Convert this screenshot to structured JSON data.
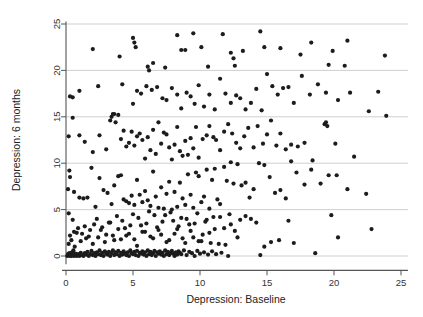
{
  "chart_data": {
    "type": "scatter",
    "title": "",
    "xlabel": "Depression: Baseline",
    "ylabel": "Depression: 6 months",
    "xlim": [
      -0.6,
      25.8
    ],
    "ylim": [
      -0.9,
      25.6
    ],
    "xticks": [
      0,
      5,
      10,
      15,
      20,
      25
    ],
    "yticks": [
      0,
      5,
      10,
      15,
      20,
      25
    ],
    "xtick_labels": [
      "0",
      "5",
      "10",
      "15",
      "20",
      "25"
    ],
    "ytick_labels": [
      "0",
      "5",
      "10",
      "15",
      "20",
      "25"
    ],
    "grid": "horizontal",
    "grid_color": "#c9c9c9",
    "legend": "none",
    "marker": "filled-circle",
    "marker_color": "#1c1c1c",
    "marker_size": 3.1,
    "n_points": 436,
    "points": [
      [
        0.1,
        0.0
      ],
      [
        0.2,
        0.1
      ],
      [
        0.3,
        0.0
      ],
      [
        0.15,
        0.2
      ],
      [
        0.4,
        0.0
      ],
      [
        0.25,
        0.3
      ],
      [
        0.5,
        0.1
      ],
      [
        0.6,
        0.0
      ],
      [
        0.35,
        0.15
      ],
      [
        0.7,
        0.25
      ],
      [
        0.8,
        0.0
      ],
      [
        0.45,
        0.4
      ],
      [
        0.9,
        0.2
      ],
      [
        1.0,
        0.0
      ],
      [
        1.1,
        0.35
      ],
      [
        1.2,
        0.1
      ],
      [
        0.55,
        0.6
      ],
      [
        1.3,
        0.0
      ],
      [
        1.4,
        0.3
      ],
      [
        1.5,
        0.15
      ],
      [
        0.65,
        1.0
      ],
      [
        1.6,
        0.45
      ],
      [
        1.7,
        0.0
      ],
      [
        1.8,
        0.2
      ],
      [
        0.2,
        1.3
      ],
      [
        1.9,
        0.55
      ],
      [
        2.0,
        0.1
      ],
      [
        2.1,
        0.3
      ],
      [
        0.4,
        1.7
      ],
      [
        2.2,
        0.0
      ],
      [
        2.3,
        0.4
      ],
      [
        2.4,
        0.2
      ],
      [
        0.3,
        2.2
      ],
      [
        2.5,
        0.6
      ],
      [
        2.6,
        0.1
      ],
      [
        2.7,
        0.35
      ],
      [
        0.6,
        2.6
      ],
      [
        2.8,
        0.0
      ],
      [
        2.9,
        0.5
      ],
      [
        3.0,
        0.25
      ],
      [
        0.9,
        3.0
      ],
      [
        3.1,
        0.15
      ],
      [
        3.2,
        0.45
      ],
      [
        3.3,
        0.0
      ],
      [
        1.2,
        2.4
      ],
      [
        3.4,
        0.3
      ],
      [
        3.5,
        0.6
      ],
      [
        3.6,
        0.1
      ],
      [
        1.5,
        1.9
      ],
      [
        3.7,
        0.4
      ],
      [
        3.8,
        0.2
      ],
      [
        3.9,
        0.55
      ],
      [
        1.8,
        2.8
      ],
      [
        4.0,
        0.0
      ],
      [
        4.1,
        0.35
      ],
      [
        4.2,
        0.15
      ],
      [
        2.1,
        3.4
      ],
      [
        4.3,
        0.5
      ],
      [
        4.4,
        0.25
      ],
      [
        4.5,
        0.1
      ],
      [
        2.4,
        2.0
      ],
      [
        4.6,
        0.4
      ],
      [
        4.7,
        0.0
      ],
      [
        4.8,
        0.6
      ],
      [
        2.7,
        3.1
      ],
      [
        4.9,
        0.3
      ],
      [
        5.0,
        0.2
      ],
      [
        5.1,
        0.45
      ],
      [
        3.0,
        2.3
      ],
      [
        5.2,
        0.1
      ],
      [
        5.3,
        0.55
      ],
      [
        5.4,
        0.0
      ],
      [
        3.3,
        3.6
      ],
      [
        5.5,
        0.35
      ],
      [
        5.6,
        0.25
      ],
      [
        5.7,
        0.5
      ],
      [
        3.6,
        1.7
      ],
      [
        5.8,
        0.15
      ],
      [
        5.9,
        0.4
      ],
      [
        6.0,
        0.0
      ],
      [
        3.9,
        2.9
      ],
      [
        6.1,
        0.6
      ],
      [
        6.2,
        0.2
      ],
      [
        6.3,
        0.45
      ],
      [
        4.2,
        3.8
      ],
      [
        6.4,
        0.1
      ],
      [
        6.5,
        0.3
      ],
      [
        6.6,
        0.55
      ],
      [
        4.5,
        2.2
      ],
      [
        6.7,
        0.0
      ],
      [
        6.8,
        0.4
      ],
      [
        6.9,
        0.25
      ],
      [
        4.8,
        3.3
      ],
      [
        7.0,
        0.5
      ],
      [
        7.1,
        0.15
      ],
      [
        7.2,
        0.35
      ],
      [
        5.1,
        1.8
      ],
      [
        7.3,
        0.0
      ],
      [
        7.4,
        0.6
      ],
      [
        7.5,
        0.2
      ],
      [
        5.4,
        4.1
      ],
      [
        7.6,
        0.45
      ],
      [
        7.7,
        0.1
      ],
      [
        7.8,
        0.3
      ],
      [
        5.7,
        2.6
      ],
      [
        7.9,
        0.55
      ],
      [
        8.0,
        0.25
      ],
      [
        8.1,
        0.0
      ],
      [
        6.0,
        3.5
      ],
      [
        8.2,
        0.4
      ],
      [
        8.3,
        0.15
      ],
      [
        8.4,
        0.5
      ],
      [
        6.3,
        2.1
      ],
      [
        8.5,
        0.35
      ],
      [
        8.6,
        0.2
      ],
      [
        8.8,
        0.6
      ],
      [
        6.6,
        4.4
      ],
      [
        9.0,
        0.1
      ],
      [
        9.2,
        0.45
      ],
      [
        9.4,
        0.3
      ],
      [
        6.9,
        2.8
      ],
      [
        9.6,
        0.0
      ],
      [
        9.8,
        0.55
      ],
      [
        10.0,
        0.25
      ],
      [
        7.2,
        3.7
      ],
      [
        10.3,
        0.4
      ],
      [
        10.6,
        0.15
      ],
      [
        10.9,
        0.5
      ],
      [
        7.5,
        1.5
      ],
      [
        11.2,
        0.2
      ],
      [
        11.6,
        0.35
      ],
      [
        12.1,
        0.0
      ],
      [
        7.8,
        4.7
      ],
      [
        14.5,
        0.1
      ],
      [
        18.6,
        0.3
      ],
      [
        8.1,
        2.4
      ],
      [
        8.4,
        3.2
      ],
      [
        8.7,
        1.9
      ],
      [
        9.0,
        4.0
      ],
      [
        9.3,
        2.7
      ],
      [
        9.6,
        3.5
      ],
      [
        9.9,
        1.6
      ],
      [
        10.2,
        2.3
      ],
      [
        10.5,
        3.9
      ],
      [
        10.8,
        1.4
      ],
      [
        11.1,
        2.9
      ],
      [
        11.5,
        4.2
      ],
      [
        11.9,
        1.2
      ],
      [
        12.3,
        3.4
      ],
      [
        12.8,
        2.0
      ],
      [
        0.2,
        4.6
      ],
      [
        0.5,
        3.9
      ],
      [
        0.8,
        2.5
      ],
      [
        1.1,
        1.6
      ],
      [
        1.4,
        3.2
      ],
      [
        1.7,
        2.1
      ],
      [
        2.0,
        1.3
      ],
      [
        2.3,
        4.0
      ],
      [
        2.6,
        2.8
      ],
      [
        2.9,
        1.5
      ],
      [
        3.2,
        3.6
      ],
      [
        3.5,
        2.2
      ],
      [
        3.8,
        4.3
      ],
      [
        4.1,
        1.8
      ],
      [
        4.4,
        3.0
      ],
      [
        4.7,
        2.4
      ],
      [
        5.0,
        4.5
      ],
      [
        5.3,
        1.1
      ],
      [
        5.6,
        3.3
      ],
      [
        5.9,
        2.6
      ],
      [
        6.2,
        4.8
      ],
      [
        6.5,
        1.9
      ],
      [
        6.8,
        3.1
      ],
      [
        7.1,
        2.3
      ],
      [
        7.4,
        4.4
      ],
      [
        7.7,
        1.7
      ],
      [
        8.0,
        3.8
      ],
      [
        8.3,
        2.9
      ],
      [
        8.6,
        4.1
      ],
      [
        8.9,
        1.4
      ],
      [
        9.2,
        3.4
      ],
      [
        9.5,
        2.0
      ],
      [
        9.8,
        4.6
      ],
      [
        10.1,
        1.6
      ],
      [
        10.4,
        3.7
      ],
      [
        10.7,
        2.5
      ],
      [
        11.0,
        4.2
      ],
      [
        11.4,
        1.3
      ],
      [
        11.8,
        3.0
      ],
      [
        12.2,
        4.5
      ],
      [
        12.6,
        2.7
      ],
      [
        13.0,
        3.9
      ],
      [
        13.4,
        4.3
      ],
      [
        13.8,
        4.0
      ],
      [
        14.2,
        3.6
      ],
      [
        14.8,
        1.0
      ],
      [
        15.3,
        1.5
      ],
      [
        15.9,
        1.7
      ],
      [
        16.6,
        3.8
      ],
      [
        17.0,
        1.4
      ],
      [
        19.8,
        4.4
      ],
      [
        20.3,
        2.0
      ],
      [
        22.8,
        2.9
      ],
      [
        0.15,
        7.2
      ],
      [
        0.3,
        8.5
      ],
      [
        0.25,
        9.2
      ],
      [
        0.6,
        6.9
      ],
      [
        1.0,
        6.3
      ],
      [
        1.3,
        6.2
      ],
      [
        1.6,
        6.3
      ],
      [
        1.9,
        9.5
      ],
      [
        2.2,
        5.3
      ],
      [
        2.5,
        8.4
      ],
      [
        2.8,
        7.1
      ],
      [
        3.1,
        6.8
      ],
      [
        3.4,
        5.6
      ],
      [
        3.6,
        7.6
      ],
      [
        3.9,
        8.6
      ],
      [
        4.1,
        8.7
      ],
      [
        4.3,
        6.1
      ],
      [
        4.5,
        5.9
      ],
      [
        4.7,
        5.7
      ],
      [
        4.9,
        6.5
      ],
      [
        5.1,
        5.5
      ],
      [
        5.3,
        8.2
      ],
      [
        5.5,
        6.6
      ],
      [
        5.7,
        5.8
      ],
      [
        5.9,
        7.0
      ],
      [
        6.1,
        6.0
      ],
      [
        6.3,
        5.4
      ],
      [
        6.5,
        9.1
      ],
      [
        6.7,
        6.4
      ],
      [
        6.9,
        5.2
      ],
      [
        7.1,
        7.4
      ],
      [
        7.3,
        5.1
      ],
      [
        7.5,
        6.7
      ],
      [
        7.7,
        8.0
      ],
      [
        7.9,
        5.0
      ],
      [
        8.1,
        6.9
      ],
      [
        8.3,
        5.3
      ],
      [
        8.5,
        7.9
      ],
      [
        8.7,
        6.2
      ],
      [
        8.9,
        5.5
      ],
      [
        9.1,
        8.8
      ],
      [
        9.3,
        6.6
      ],
      [
        9.5,
        5.2
      ],
      [
        9.7,
        9.0
      ],
      [
        9.9,
        8.6
      ],
      [
        10.1,
        5.8
      ],
      [
        10.3,
        6.4
      ],
      [
        10.5,
        9.3
      ],
      [
        10.7,
        5.1
      ],
      [
        10.9,
        8.2
      ],
      [
        11.1,
        9.4
      ],
      [
        11.3,
        6.1
      ],
      [
        11.5,
        5.6
      ],
      [
        11.8,
        9.6
      ],
      [
        12.0,
        8.1
      ],
      [
        12.3,
        10.1
      ],
      [
        12.5,
        7.8
      ],
      [
        12.8,
        9.9
      ],
      [
        13.1,
        7.6
      ],
      [
        13.4,
        7.9
      ],
      [
        13.7,
        6.3
      ],
      [
        14.0,
        7.2
      ],
      [
        14.4,
        10.0
      ],
      [
        14.8,
        9.8
      ],
      [
        15.2,
        8.5
      ],
      [
        15.6,
        6.8
      ],
      [
        16.0,
        7.1
      ],
      [
        16.4,
        6.2
      ],
      [
        16.8,
        10.2
      ],
      [
        17.2,
        9.0
      ],
      [
        17.8,
        7.7
      ],
      [
        18.3,
        9.3
      ],
      [
        19.0,
        7.8
      ],
      [
        19.6,
        8.7
      ],
      [
        20.2,
        8.7
      ],
      [
        21.0,
        7.2
      ],
      [
        21.5,
        10.7
      ],
      [
        22.4,
        6.7
      ],
      [
        0.2,
        12.9
      ],
      [
        0.5,
        14.9
      ],
      [
        1.0,
        13.0
      ],
      [
        1.4,
        12.3
      ],
      [
        2.0,
        11.2
      ],
      [
        2.5,
        13.0
      ],
      [
        3.0,
        11.5
      ],
      [
        3.3,
        14.6
      ],
      [
        3.5,
        15.3
      ],
      [
        3.7,
        14.4
      ],
      [
        3.9,
        15.2
      ],
      [
        4.1,
        12.6
      ],
      [
        4.3,
        13.5
      ],
      [
        4.5,
        11.8
      ],
      [
        4.7,
        12.2
      ],
      [
        4.9,
        13.4
      ],
      [
        5.1,
        11.9
      ],
      [
        5.3,
        12.9
      ],
      [
        5.5,
        13.2
      ],
      [
        5.7,
        12.5
      ],
      [
        5.9,
        10.5
      ],
      [
        6.1,
        12.8
      ],
      [
        6.3,
        11.4
      ],
      [
        6.5,
        13.6
      ],
      [
        6.7,
        11.0
      ],
      [
        6.9,
        14.4
      ],
      [
        7.1,
        12.1
      ],
      [
        7.3,
        13.3
      ],
      [
        7.5,
        13.1
      ],
      [
        7.7,
        11.7
      ],
      [
        7.9,
        10.4
      ],
      [
        8.1,
        12.0
      ],
      [
        8.3,
        13.9
      ],
      [
        8.5,
        11.3
      ],
      [
        8.7,
        10.8
      ],
      [
        8.9,
        12.4
      ],
      [
        9.1,
        10.9
      ],
      [
        9.3,
        12.7
      ],
      [
        9.5,
        11.6
      ],
      [
        9.7,
        13.9
      ],
      [
        9.9,
        10.6
      ],
      [
        10.2,
        12.6
      ],
      [
        10.5,
        13.0
      ],
      [
        10.7,
        14.0
      ],
      [
        11.0,
        12.8
      ],
      [
        11.2,
        12.5
      ],
      [
        11.5,
        11.4
      ],
      [
        11.8,
        13.4
      ],
      [
        12.1,
        14.2
      ],
      [
        12.4,
        13.2
      ],
      [
        12.7,
        12.2
      ],
      [
        13.0,
        11.6
      ],
      [
        13.3,
        12.9
      ],
      [
        13.6,
        13.8
      ],
      [
        14.0,
        11.7
      ],
      [
        14.3,
        14.0
      ],
      [
        14.7,
        12.1
      ],
      [
        15.0,
        13.1
      ],
      [
        15.3,
        14.6
      ],
      [
        15.7,
        11.9
      ],
      [
        16.0,
        13.2
      ],
      [
        16.4,
        11.5
      ],
      [
        16.8,
        12.0
      ],
      [
        17.3,
        11.8
      ],
      [
        17.8,
        12.2
      ],
      [
        18.4,
        10.3
      ],
      [
        19.3,
        14.2
      ],
      [
        19.4,
        14.4
      ],
      [
        19.5,
        14.0
      ],
      [
        20.1,
        12.1
      ],
      [
        23.9,
        15.1
      ],
      [
        0.3,
        17.2
      ],
      [
        0.5,
        17.1
      ],
      [
        1.0,
        17.8
      ],
      [
        2.4,
        18.3
      ],
      [
        3.4,
        15.0
      ],
      [
        3.6,
        15.3
      ],
      [
        4.2,
        18.5
      ],
      [
        5.0,
        16.4
      ],
      [
        5.3,
        17.8
      ],
      [
        5.6,
        17.5
      ],
      [
        6.0,
        18.3
      ],
      [
        6.4,
        17.9
      ],
      [
        6.8,
        18.2
      ],
      [
        7.2,
        17.0
      ],
      [
        7.5,
        16.8
      ],
      [
        7.9,
        18.1
      ],
      [
        8.3,
        17.4
      ],
      [
        8.6,
        15.9
      ],
      [
        9.0,
        17.6
      ],
      [
        9.3,
        17.2
      ],
      [
        9.6,
        16.4
      ],
      [
        9.9,
        18.4
      ],
      [
        10.3,
        16.1
      ],
      [
        10.7,
        17.4
      ],
      [
        11.1,
        15.8
      ],
      [
        11.5,
        19.1
      ],
      [
        11.9,
        17.5
      ],
      [
        12.3,
        16.5
      ],
      [
        12.7,
        17.3
      ],
      [
        13.0,
        17.0
      ],
      [
        13.4,
        15.8
      ],
      [
        13.8,
        16.5
      ],
      [
        14.2,
        18.0
      ],
      [
        14.6,
        15.7
      ],
      [
        15.0,
        19.6
      ],
      [
        15.4,
        18.3
      ],
      [
        15.8,
        17.4
      ],
      [
        16.2,
        18.1
      ],
      [
        16.6,
        18.2
      ],
      [
        17.0,
        16.5
      ],
      [
        17.6,
        19.4
      ],
      [
        18.2,
        17.4
      ],
      [
        18.8,
        18.5
      ],
      [
        19.4,
        17.6
      ],
      [
        20.3,
        16.8
      ],
      [
        21.2,
        17.6
      ],
      [
        22.6,
        15.6
      ],
      [
        23.3,
        17.7
      ],
      [
        2.0,
        22.3
      ],
      [
        4.0,
        21.5
      ],
      [
        5.0,
        23.5
      ],
      [
        5.1,
        23.0
      ],
      [
        5.2,
        22.5
      ],
      [
        6.1,
        20.4
      ],
      [
        6.2,
        20.0
      ],
      [
        6.5,
        20.8
      ],
      [
        7.4,
        20.3
      ],
      [
        8.3,
        23.8
      ],
      [
        8.6,
        22.2
      ],
      [
        8.9,
        22.2
      ],
      [
        9.5,
        24.0
      ],
      [
        10.1,
        22.5
      ],
      [
        10.6,
        20.4
      ],
      [
        11.7,
        23.9
      ],
      [
        12.3,
        21.9
      ],
      [
        12.5,
        21.3
      ],
      [
        12.6,
        20.5
      ],
      [
        13.2,
        22.1
      ],
      [
        14.5,
        24.2
      ],
      [
        14.8,
        22.5
      ],
      [
        16.0,
        22.4
      ],
      [
        17.5,
        21.7
      ],
      [
        18.3,
        23.0
      ],
      [
        19.6,
        20.6
      ],
      [
        19.9,
        22.1
      ],
      [
        20.8,
        20.5
      ],
      [
        21.0,
        23.2
      ],
      [
        23.8,
        21.6
      ]
    ]
  }
}
